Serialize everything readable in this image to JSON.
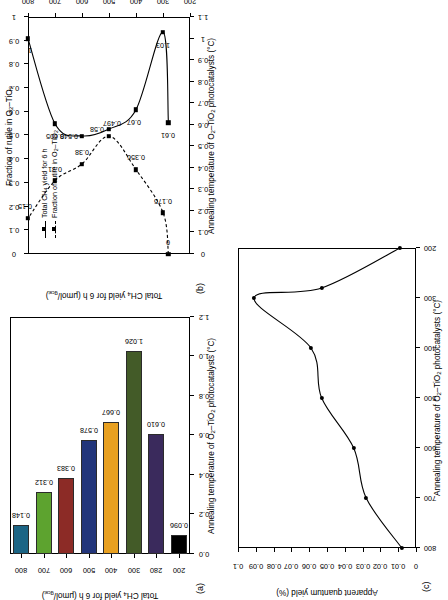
{
  "figure": {
    "panels": [
      "a",
      "b",
      "c"
    ],
    "shared_xlabel": "Annealing temperature of O2–TiO2 photocatalysts (°C)",
    "units_note": "μmol/g_cat"
  },
  "panel_a": {
    "label": "(a)",
    "ylabel": "Total CH4 yield for 6 h (μmol/gcat)",
    "xlabel": "Annealing temperature of O2–TiO2 photocatalysts (°C)",
    "ytick_labels": [
      "0.0",
      "0.2",
      "0.4",
      "0.6",
      "0.8",
      "1.0",
      "1.2"
    ],
    "xtick_labels": [
      "200",
      "280",
      "300",
      "400",
      "500",
      "600",
      "700",
      "800"
    ],
    "bar_values_text": [
      "0.096",
      "0.610",
      "1.026",
      "0.667",
      "0.578",
      "0.383",
      "0.312",
      "0.148"
    ],
    "bar_colors": [
      "#000000",
      "#3a2a5c",
      "#435b28",
      "#e8a020",
      "#22357a",
      "#8c2b26",
      "#5da32f",
      "#1c6585"
    ]
  },
  "panel_b": {
    "label": "(b)",
    "ylabel_left": "Total CH4 yield for 6 h (μmol/gcat)",
    "ylabel_top": "Fraction of rutile in O2–TiO2",
    "xlabel": "Annealing temperature of O2–TiO2 photocatalysts (°C)",
    "ytick_labels": [
      "0",
      "0.1",
      "0.2",
      "0.3",
      "0.4",
      "0.5",
      "0.6",
      "0.7",
      "0.8",
      "0.9",
      "1",
      "1.1"
    ],
    "top_tick_labels": [
      "0",
      "0.1",
      "0.2",
      "0.3",
      "0.4",
      "0.5",
      "0.6",
      "0.7",
      "0.8",
      "0.9",
      "1"
    ],
    "xtick_labels": [
      "200",
      "300",
      "400",
      "500",
      "600",
      "700",
      "800"
    ],
    "legend": {
      "series_1": "Total CH4 yield for 6 h",
      "series_2": "Fraction of rutile in O2–TiO2"
    },
    "yield_point_labels": [
      "0.61",
      "1.03",
      "0.67",
      "0.58",
      "0.548",
      "0.605",
      "1"
    ],
    "rutile_point_labels": [
      "0",
      "0.175",
      "0.356",
      "0.497",
      "0.38",
      "0.31",
      "0.15"
    ]
  },
  "panel_c": {
    "label": "(c)",
    "ylabel": "Apparent quantum yield (%)",
    "xlabel": "Annealing temperature of O2–TiO2 photocatalysts (°C)",
    "ytick_labels": [
      "0",
      "0.01",
      "0.02",
      "0.03",
      "0.04",
      "0.05",
      "0.06",
      "0.07",
      "0.08",
      "0.09",
      "0.1"
    ],
    "xtick_labels": [
      "200",
      "300",
      "400",
      "500",
      "600",
      "700",
      "800"
    ]
  },
  "chart_data": [
    {
      "panel": "a",
      "type": "bar",
      "title": "",
      "xlabel": "Annealing temperature of O2–TiO2 photocatalysts (°C)",
      "ylabel": "Total CH4 yield for 6 h (μmol/gcat)",
      "categories": [
        "200",
        "280",
        "300",
        "400",
        "500",
        "600",
        "700",
        "800"
      ],
      "values": [
        0.096,
        0.61,
        1.026,
        0.667,
        0.578,
        0.383,
        0.312,
        0.148
      ],
      "value_labels": [
        "0.096",
        "0.610",
        "1.026",
        "0.667",
        "0.578",
        "0.383",
        "0.312",
        "0.148"
      ],
      "colors": [
        "#000000",
        "#3a2a5c",
        "#435b28",
        "#e8a020",
        "#22357a",
        "#8c2b26",
        "#5da32f",
        "#1c6585"
      ],
      "ylim": [
        0.0,
        1.2
      ],
      "yticks": [
        0.0,
        0.2,
        0.4,
        0.6,
        0.8,
        1.0,
        1.2
      ],
      "grid": false,
      "legend": "none"
    },
    {
      "panel": "b",
      "type": "line",
      "title": "",
      "xlabel": "Annealing temperature of O2–TiO2 photocatalysts (°C)",
      "ylabel": "Total CH4 yield for 6 h (μmol/gcat)",
      "y2label": "Fraction of rutile in O2–TiO2",
      "x": [
        280,
        300,
        400,
        500,
        600,
        700,
        800
      ],
      "xlim": [
        200,
        800
      ],
      "xticks": [
        200,
        300,
        400,
        500,
        600,
        700,
        800
      ],
      "ylim": [
        0,
        1.1
      ],
      "yticks": [
        0,
        0.1,
        0.2,
        0.3,
        0.4,
        0.5,
        0.6,
        0.7,
        0.8,
        0.9,
        1.0,
        1.1
      ],
      "y2lim": [
        0,
        1
      ],
      "y2ticks": [
        0,
        0.1,
        0.2,
        0.3,
        0.4,
        0.5,
        0.6,
        0.7,
        0.8,
        0.9,
        1.0
      ],
      "grid": false,
      "legend": "upper-left",
      "series": [
        {
          "name": "Total CH4 yield for 6 h",
          "axis": "left",
          "style": "solid",
          "marker": "square",
          "x": [
            280,
            300,
            400,
            500,
            600,
            700,
            800
          ],
          "values": [
            0.61,
            1.03,
            0.67,
            0.58,
            0.548,
            0.605,
            1.0
          ],
          "point_labels": [
            "0.61",
            "1.03",
            "0.67",
            "0.58",
            "0.548",
            "0.605",
            "1"
          ]
        },
        {
          "name": "Fraction of rutile in O2–TiO2",
          "axis": "right-top",
          "style": "dashed",
          "marker": "square",
          "x": [
            280,
            300,
            400,
            500,
            600,
            700,
            800
          ],
          "values": [
            0.0,
            0.175,
            0.356,
            0.497,
            0.38,
            0.31,
            0.15
          ],
          "point_labels": [
            "0",
            "0.175",
            "0.356",
            "0.497",
            "0.38",
            "0.31",
            "0.15"
          ]
        }
      ]
    },
    {
      "panel": "c",
      "type": "line",
      "title": "",
      "xlabel": "Annealing temperature of O2–TiO2 photocatalysts (°C)",
      "ylabel": "Apparent quantum yield (%)",
      "x": [
        200,
        280,
        300,
        400,
        500,
        600,
        700,
        800
      ],
      "values": [
        0.009,
        0.053,
        0.091,
        0.059,
        0.053,
        0.035,
        0.028,
        0.008
      ],
      "xlim": [
        200,
        800
      ],
      "xticks": [
        200,
        300,
        400,
        500,
        600,
        700,
        800
      ],
      "ylim": [
        0,
        0.1
      ],
      "yticks": [
        0,
        0.01,
        0.02,
        0.03,
        0.04,
        0.05,
        0.06,
        0.07,
        0.08,
        0.09,
        0.1
      ],
      "grid": false,
      "legend": "none",
      "marker": "circle",
      "style": "solid"
    }
  ]
}
